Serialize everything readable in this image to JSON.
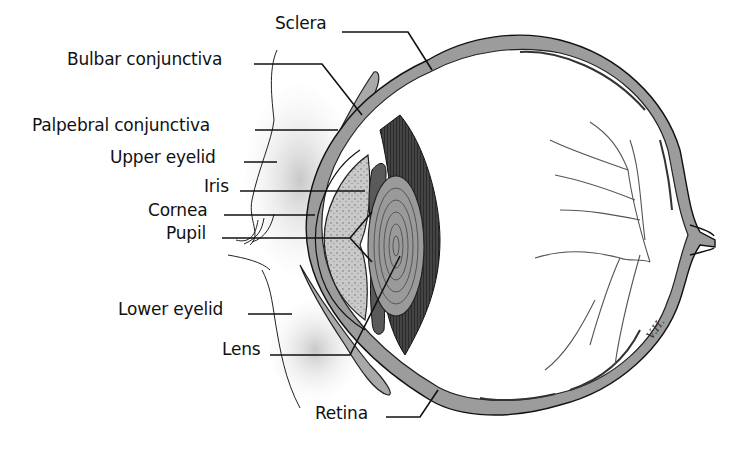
{
  "diagram": {
    "artist_signature": "V.H.",
    "labels": [
      {
        "id": "sclera",
        "text": "Sclera",
        "x": 275,
        "y": 15
      },
      {
        "id": "bulbar-conjunctiva",
        "text": "Bulbar conjunctiva",
        "x": 67,
        "y": 51
      },
      {
        "id": "palpebral-conjunctiva",
        "text": "Palpebral conjunctiva",
        "x": 32,
        "y": 116
      },
      {
        "id": "upper-eyelid",
        "text": "Upper eyelid",
        "x": 110,
        "y": 148
      },
      {
        "id": "iris",
        "text": "Iris",
        "x": 204,
        "y": 176
      },
      {
        "id": "cornea",
        "text": "Cornea",
        "x": 148,
        "y": 204
      },
      {
        "id": "pupil",
        "text": "Pupil",
        "x": 166,
        "y": 226
      },
      {
        "id": "lower-eyelid",
        "text": "Lower eyelid",
        "x": 118,
        "y": 300
      },
      {
        "id": "lens",
        "text": "Lens",
        "x": 222,
        "y": 340
      },
      {
        "id": "retina",
        "text": "Retina",
        "x": 315,
        "y": 403
      }
    ],
    "colors": {
      "ink": "#111111",
      "wall": "#9a9a9a",
      "wall_dark": "#3a3a3a",
      "ciliary": "#2b2b2b",
      "lens": "#8a8a8a",
      "aqueous": "#bdbdbd",
      "lid_shade": "#d6d6d6",
      "vessel": "#555555",
      "background": "#ffffff"
    }
  }
}
